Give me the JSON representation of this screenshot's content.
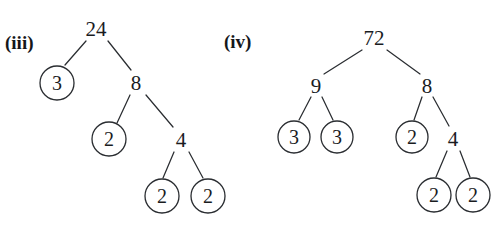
{
  "figure": {
    "type": "factor-trees",
    "background_color": "#ffffff",
    "stroke_color": "#2a2d31",
    "text_color": "#1a1c1f",
    "width": 492,
    "height": 231
  },
  "trees": [
    {
      "label": "(iii)",
      "label_x": 5,
      "label_y": 33,
      "root_value": "24",
      "nodes": [
        {
          "id": "n3_root",
          "text": "24",
          "x": 96,
          "y": 29,
          "circled": false,
          "r": 0
        },
        {
          "id": "n3_a",
          "text": "3",
          "x": 57,
          "y": 83,
          "circled": true,
          "r": 17
        },
        {
          "id": "n3_b",
          "text": "8",
          "x": 136,
          "y": 83,
          "circled": false,
          "r": 0
        },
        {
          "id": "n3_c",
          "text": "2",
          "x": 109,
          "y": 139,
          "circled": true,
          "r": 17
        },
        {
          "id": "n3_d",
          "text": "4",
          "x": 181,
          "y": 140,
          "circled": false,
          "r": 0
        },
        {
          "id": "n3_e",
          "text": "2",
          "x": 162,
          "y": 196,
          "circled": true,
          "r": 17
        },
        {
          "id": "n3_f",
          "text": "2",
          "x": 208,
          "y": 196,
          "circled": true,
          "r": 17
        }
      ],
      "edges": [
        {
          "from": "n3_root",
          "to": "n3_a",
          "x1": 86,
          "y1": 41,
          "x2": 65,
          "y2": 65
        },
        {
          "from": "n3_root",
          "to": "n3_b",
          "x1": 108,
          "y1": 41,
          "x2": 131,
          "y2": 70
        },
        {
          "from": "n3_b",
          "to": "n3_c",
          "x1": 130,
          "y1": 95,
          "x2": 117,
          "y2": 123
        },
        {
          "from": "n3_b",
          "to": "n3_d",
          "x1": 146,
          "y1": 95,
          "x2": 173,
          "y2": 127
        },
        {
          "from": "n3_d",
          "to": "n3_e",
          "x1": 174,
          "y1": 152,
          "x2": 163,
          "y2": 178
        },
        {
          "from": "n3_d",
          "to": "n3_f",
          "x1": 189,
          "y1": 152,
          "x2": 203,
          "y2": 178
        }
      ]
    },
    {
      "label": "(iv)",
      "label_x": 224,
      "label_y": 32,
      "root_value": "72",
      "nodes": [
        {
          "id": "n4_root",
          "text": "72",
          "x": 374,
          "y": 38,
          "circled": false,
          "r": 0
        },
        {
          "id": "n4_a",
          "text": "9",
          "x": 316,
          "y": 86,
          "circled": false,
          "r": 0
        },
        {
          "id": "n4_b",
          "text": "8",
          "x": 427,
          "y": 86,
          "circled": false,
          "r": 0
        },
        {
          "id": "n4_c",
          "text": "3",
          "x": 294,
          "y": 137,
          "circled": true,
          "r": 16
        },
        {
          "id": "n4_d",
          "text": "3",
          "x": 337,
          "y": 137,
          "circled": true,
          "r": 16
        },
        {
          "id": "n4_e",
          "text": "2",
          "x": 412,
          "y": 137,
          "circled": true,
          "r": 16
        },
        {
          "id": "n4_f",
          "text": "4",
          "x": 453,
          "y": 139,
          "circled": false,
          "r": 0
        },
        {
          "id": "n4_g",
          "text": "2",
          "x": 434,
          "y": 195,
          "circled": true,
          "r": 17
        },
        {
          "id": "n4_h",
          "text": "2",
          "x": 473,
          "y": 195,
          "circled": true,
          "r": 17
        }
      ],
      "edges": [
        {
          "from": "n4_root",
          "to": "n4_a",
          "x1": 362,
          "y1": 50,
          "x2": 324,
          "y2": 74
        },
        {
          "from": "n4_root",
          "to": "n4_b",
          "x1": 387,
          "y1": 50,
          "x2": 420,
          "y2": 74
        },
        {
          "from": "n4_a",
          "to": "n4_c",
          "x1": 311,
          "y1": 97,
          "x2": 299,
          "y2": 120
        },
        {
          "from": "n4_a",
          "to": "n4_d",
          "x1": 322,
          "y1": 97,
          "x2": 333,
          "y2": 120
        },
        {
          "from": "n4_b",
          "to": "n4_e",
          "x1": 422,
          "y1": 97,
          "x2": 414,
          "y2": 120
        },
        {
          "from": "n4_b",
          "to": "n4_f",
          "x1": 433,
          "y1": 97,
          "x2": 449,
          "y2": 126
        },
        {
          "from": "n4_f",
          "to": "n4_g",
          "x1": 447,
          "y1": 151,
          "x2": 436,
          "y2": 177
        },
        {
          "from": "n4_f",
          "to": "n4_h",
          "x1": 460,
          "y1": 151,
          "x2": 470,
          "y2": 177
        }
      ]
    }
  ]
}
